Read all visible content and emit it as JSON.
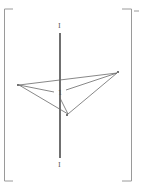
{
  "diagram": {
    "type": "geometric-structure",
    "colors": {
      "line": "#6a6a6a",
      "axis": "#222222",
      "bracket": "#9a9a9a",
      "background": "#ffffff"
    },
    "axis": {
      "top_label": "I",
      "bottom_label": "I",
      "center_label": "1"
    },
    "vertices": [
      {
        "id": "left",
        "label": "",
        "x": 19,
        "y": 85
      },
      {
        "id": "right",
        "label": "",
        "x": 117,
        "y": 73
      },
      {
        "id": "bottom",
        "label": "",
        "x": 68,
        "y": 114
      }
    ]
  }
}
